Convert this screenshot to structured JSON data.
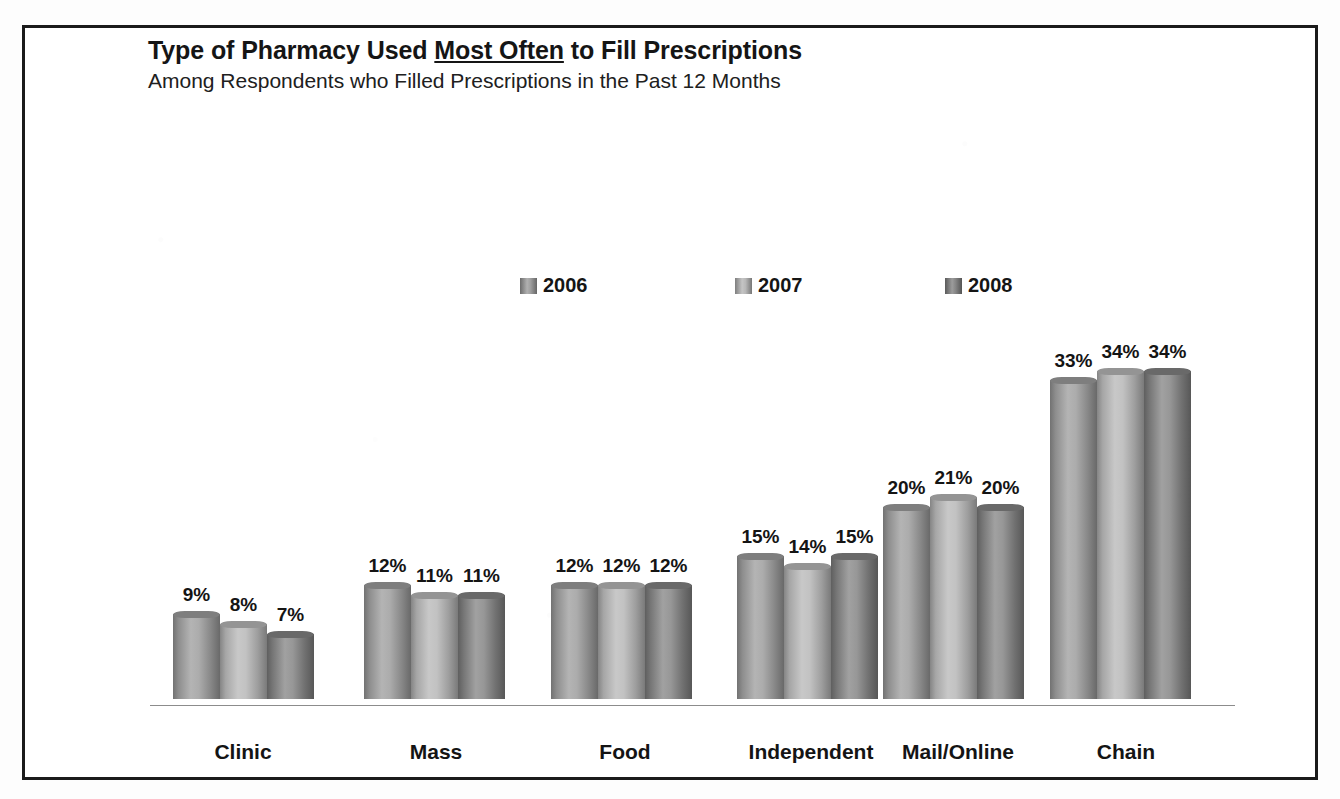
{
  "chart_data": {
    "type": "bar",
    "title": "Type of Pharmacy Used Most Often to Fill Prescriptions",
    "title_plain_before": "Type of Pharmacy Used ",
    "title_emphasis": "Most Often",
    "title_plain_after": " to Fill Prescriptions",
    "subtitle": "Among Respondents who Filled Prescriptions in the Past 12 Months",
    "xlabel": "",
    "ylabel": "",
    "ylim": [
      0,
      36
    ],
    "grid": false,
    "legend_position": "top-center",
    "value_suffix": "%",
    "categories": [
      "Clinic",
      "Mass",
      "Food",
      "Independent",
      "Mail/Online",
      "Chain"
    ],
    "series": [
      {
        "name": "2006",
        "color": "#9a9a9a",
        "values": [
          9,
          12,
          12,
          15,
          20,
          33
        ],
        "labels": [
          "9%",
          "12%",
          "12%",
          "15%",
          "20%",
          "33%"
        ]
      },
      {
        "name": "2007",
        "color": "#b4b4b4",
        "values": [
          8,
          11,
          12,
          14,
          21,
          34
        ],
        "labels": [
          "8%",
          "11%",
          "12%",
          "14%",
          "21%",
          "34%"
        ]
      },
      {
        "name": "2008",
        "color": "#808080",
        "values": [
          7,
          11,
          12,
          15,
          20,
          34
        ],
        "labels": [
          "7%",
          "11%",
          "12%",
          "15%",
          "20%",
          "34%"
        ]
      }
    ]
  },
  "legend": {
    "items": [
      {
        "label": "2006",
        "swatch": "legend-swatch-2006"
      },
      {
        "label": "2007",
        "swatch": "legend-swatch-2007"
      },
      {
        "label": "2008",
        "swatch": "legend-swatch-2008"
      }
    ]
  },
  "colors": {
    "frame": "#1b1b1b",
    "background": "#ffffff",
    "axis_line": "#8c8c8c",
    "text": "#141414",
    "series_2006": "#9a9a9a",
    "series_2007": "#b4b4b4",
    "series_2008": "#808080"
  }
}
